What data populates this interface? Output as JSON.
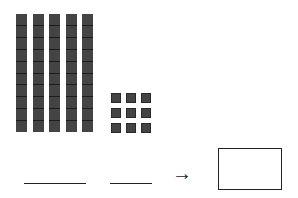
{
  "diagram": {
    "tens_rods": 5,
    "cells_per_rod": 10,
    "unit_cubes": 9,
    "unit_grid": "3x3",
    "blanks": [
      "",
      ""
    ],
    "arrow_symbol": "→",
    "answer_box_value": ""
  }
}
